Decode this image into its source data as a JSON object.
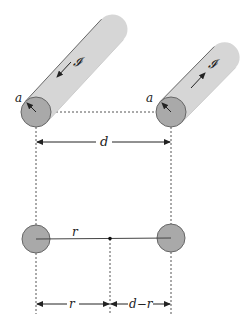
{
  "diagram": {
    "colors": {
      "wire_body": "#d6d6d6",
      "wire_end": "#a9a9a9",
      "outline": "#666666",
      "text": "#222222"
    },
    "wires": [
      {
        "id": "left",
        "current_label": "I",
        "current_direction": "toward-viewer",
        "radius_label": "a"
      },
      {
        "id": "right",
        "current_label": "I",
        "current_direction": "away-from-viewer",
        "radius_label": "a"
      }
    ],
    "labels": {
      "current_left": "𝓘",
      "current_right": "𝓘",
      "radius_left": "a",
      "radius_right": "a",
      "separation": "d",
      "cross_section_r": "r",
      "bottom_r": "r",
      "bottom_d_minus_r": "d−r"
    }
  }
}
